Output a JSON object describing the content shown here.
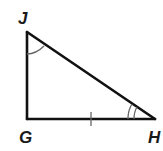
{
  "diagram": {
    "type": "right-triangle",
    "vertices": [
      {
        "name": "J",
        "x": 27,
        "y": 32,
        "label_x": 18,
        "label_y": 24
      },
      {
        "name": "G",
        "x": 27,
        "y": 119,
        "label_x": 19,
        "label_y": 143
      },
      {
        "name": "H",
        "x": 155,
        "y": 119,
        "label_x": 148,
        "label_y": 143
      }
    ],
    "sides": [
      {
        "from": "J",
        "to": "G"
      },
      {
        "from": "G",
        "to": "H",
        "tick_marks": 1
      },
      {
        "from": "H",
        "to": "J"
      }
    ],
    "angle_marks": [
      {
        "vertex": "J",
        "arcs": 1
      },
      {
        "vertex": "H",
        "arcs": 2
      }
    ],
    "right_angle_at": "G",
    "labels": {
      "J": "J",
      "G": "G",
      "H": "H"
    }
  }
}
